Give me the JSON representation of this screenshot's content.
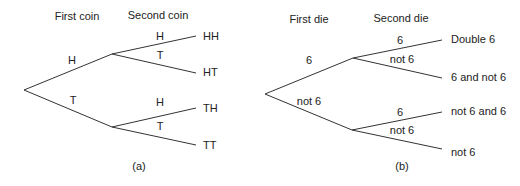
{
  "diagrams": [
    {
      "id": "a",
      "caption": "(a)",
      "caption_pos": [
        139,
        170
      ],
      "headers": [
        {
          "text": "First coin",
          "x": 77,
          "y": 20
        },
        {
          "text": "Second coin",
          "x": 158,
          "y": 19
        }
      ],
      "root": [
        24,
        90
      ],
      "branches": [
        {
          "from": [
            24,
            90
          ],
          "to": [
            112,
            54
          ],
          "label": "H",
          "label_pos": [
            72,
            64
          ]
        },
        {
          "from": [
            24,
            90
          ],
          "to": [
            112,
            127
          ],
          "label": "T",
          "label_pos": [
            73,
            104
          ]
        },
        {
          "from": [
            112,
            54
          ],
          "to": [
            196,
            36
          ],
          "label": "H",
          "label_pos": [
            160,
            40
          ]
        },
        {
          "from": [
            112,
            54
          ],
          "to": [
            196,
            73
          ],
          "label": "T",
          "label_pos": [
            160,
            59
          ]
        },
        {
          "from": [
            112,
            127
          ],
          "to": [
            196,
            108
          ],
          "label": "H",
          "label_pos": [
            160,
            106
          ]
        },
        {
          "from": [
            112,
            127
          ],
          "to": [
            196,
            145
          ],
          "label": "T",
          "label_pos": [
            160,
            130
          ]
        }
      ],
      "outcomes": [
        {
          "text": "HH",
          "x": 203,
          "y": 40
        },
        {
          "text": "HT",
          "x": 203,
          "y": 76
        },
        {
          "text": "TH",
          "x": 203,
          "y": 112
        },
        {
          "text": "TT",
          "x": 203,
          "y": 149
        }
      ]
    },
    {
      "id": "b",
      "caption": "(b)",
      "caption_pos": [
        402,
        170
      ],
      "headers": [
        {
          "text": "First die",
          "x": 309,
          "y": 23
        },
        {
          "text": "Second die",
          "x": 401,
          "y": 22
        }
      ],
      "root": [
        265,
        94
      ],
      "branches": [
        {
          "from": [
            265,
            94
          ],
          "to": [
            353,
            58
          ],
          "label": "6",
          "label_pos": [
            309,
            64
          ]
        },
        {
          "from": [
            265,
            94
          ],
          "to": [
            352,
            130
          ],
          "label": "not 6",
          "label_pos": [
            309,
            105
          ]
        },
        {
          "from": [
            353,
            58
          ],
          "to": [
            442,
            40
          ],
          "label": "6",
          "label_pos": [
            400,
            44
          ]
        },
        {
          "from": [
            353,
            58
          ],
          "to": [
            442,
            78
          ],
          "label": "not 6",
          "label_pos": [
            402,
            63
          ]
        },
        {
          "from": [
            352,
            130
          ],
          "to": [
            442,
            112
          ],
          "label": "6",
          "label_pos": [
            400,
            116
          ]
        },
        {
          "from": [
            352,
            130
          ],
          "to": [
            442,
            149
          ],
          "label": "not 6",
          "label_pos": [
            402,
            134
          ]
        }
      ],
      "outcomes": [
        {
          "text": "Double 6",
          "x": 451,
          "y": 43
        },
        {
          "text": "6 and not 6",
          "x": 451,
          "y": 81
        },
        {
          "text": "not 6 and 6",
          "x": 451,
          "y": 115
        },
        {
          "text": "not 6",
          "x": 451,
          "y": 156
        }
      ]
    }
  ],
  "colors": {
    "line": "#333333",
    "text": "#222222",
    "background": "#ffffff"
  }
}
